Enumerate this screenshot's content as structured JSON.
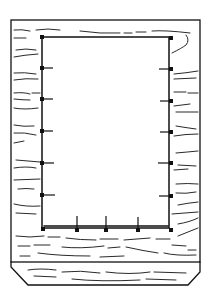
{
  "diagram": {
    "type": "line-art",
    "stroke_color": "#111111",
    "background": "#ffffff",
    "outer_frame": {
      "x": 11,
      "y": 20,
      "w": 189,
      "h": 242
    },
    "opening": {
      "x": 42,
      "y": 37,
      "w": 127,
      "h": 191
    },
    "base": {
      "top_left": [
        11,
        262
      ],
      "top_right": [
        200,
        262
      ],
      "bottom_left": [
        28,
        285
      ],
      "bottom_right": [
        188,
        285
      ]
    },
    "left_nails_y": [
      68,
      99,
      131,
      163,
      195
    ],
    "right_nails_y": [
      69,
      101,
      132,
      163,
      196
    ],
    "bottom_nails_x": [
      77,
      106,
      138
    ]
  }
}
